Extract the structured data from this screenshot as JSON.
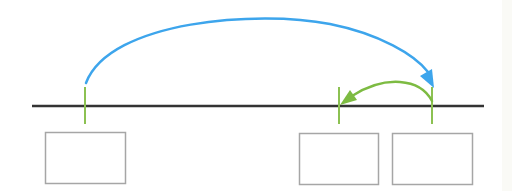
{
  "diagram": {
    "type": "timeline-move-diagram",
    "colors": {
      "timeline": "#333333",
      "tick": "#8cc152",
      "blue_arrow": "#3da5ec",
      "green_arrow": "#7dbb42",
      "box_border": "#a6a6a6",
      "edge_strip": "#fafaf6"
    },
    "timeline": {
      "x1": 32,
      "x2": 484,
      "y": 106
    },
    "ticks": [
      {
        "x": 85,
        "y1": 87,
        "y2": 124
      },
      {
        "x": 339,
        "y1": 87,
        "y2": 124
      },
      {
        "x": 432,
        "y1": 87,
        "y2": 124
      }
    ],
    "boxes": [
      {
        "x": 45,
        "y": 132,
        "w": 80,
        "h": 51
      },
      {
        "x": 299,
        "y": 133,
        "w": 79,
        "h": 51
      },
      {
        "x": 392,
        "y": 133,
        "w": 80,
        "h": 51
      }
    ],
    "arrows": [
      {
        "name": "blue-move-arrow",
        "from_tick": 0,
        "to_tick": 2,
        "direction": "right"
      },
      {
        "name": "green-move-arrow",
        "from_tick": 2,
        "to_tick": 1,
        "direction": "left"
      }
    ]
  }
}
